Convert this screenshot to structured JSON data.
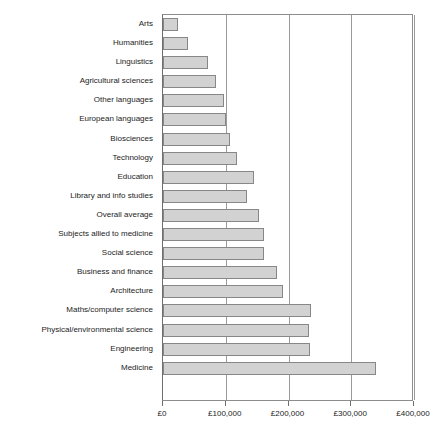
{
  "chart_data": {
    "type": "bar",
    "orientation": "horizontal",
    "title": "",
    "subtitle": "",
    "xlabel": "",
    "ylabel": "",
    "xlim": [
      0,
      400000
    ],
    "grid": true,
    "legend": null,
    "currency_symbol": "£",
    "xticks": [
      0,
      100000,
      200000,
      300000,
      400000
    ],
    "xtick_labels": [
      "£0",
      "£100,000",
      "£200,000",
      "£300,000",
      "£400,000"
    ],
    "categories": [
      "Arts",
      "Humanities",
      "Linguistics",
      "Agricultural sciences",
      "Other languages",
      "European languages",
      "Biosciences",
      "Technology",
      "Education",
      "Library and info studies",
      "Overall average",
      "Subjects allied to medicine",
      "Social science",
      "Business and finance",
      "Architecture",
      "Maths/computer science",
      "Physical/environmental science",
      "Engineering",
      "Medicine"
    ],
    "values": [
      24000,
      40000,
      72000,
      85000,
      98000,
      100000,
      106000,
      118000,
      145000,
      134000,
      153000,
      161000,
      161000,
      182000,
      192000,
      236000,
      232000,
      234000,
      340000
    ],
    "series": [
      {
        "name": "Lifetime earnings",
        "values": [
          24000,
          40000,
          72000,
          85000,
          98000,
          100000,
          106000,
          118000,
          145000,
          134000,
          153000,
          161000,
          161000,
          182000,
          192000,
          236000,
          232000,
          234000,
          340000
        ]
      }
    ],
    "colors": {
      "bar_fill": "#d2d2d2",
      "bar_border": "#878787",
      "gridline": "#9a9a9a",
      "axis": "#6e6e6e",
      "text": "#1c1c1c",
      "background": "#ffffff"
    }
  }
}
